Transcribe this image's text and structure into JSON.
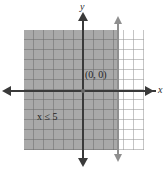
{
  "figure": {
    "name": "linear-inequality-graph",
    "origin_label": "(0, 0)",
    "inequality_variable": "x",
    "inequality_relation": "≤",
    "inequality_value": "5",
    "inequality_label": "x ≤ 5",
    "axis": {
      "x_label": "x",
      "y_label": "y"
    },
    "colors": {
      "shaded_region": "#a9a9a9",
      "grid_line": "#969696",
      "axis_line": "#3a3a3a",
      "boundary_line": "#8f8f8f",
      "background": "#ffffff"
    }
  },
  "chart_data": {
    "type": "line",
    "title": "",
    "xlabel": "x",
    "ylabel": "y",
    "xlim": [
      -6,
      6
    ],
    "ylim": [
      -6,
      6
    ],
    "grid": true,
    "legend": "none",
    "origin_annotation": "(0, 0)",
    "annotations": [
      {
        "text": "x ≤ 5",
        "x": -4.5,
        "y": -2.2
      },
      {
        "text": "(0, 0)",
        "x": 0.3,
        "y": 1.0
      }
    ],
    "series": [
      {
        "name": "boundary x = 5",
        "type": "vertical-line",
        "x": 5,
        "style": "solid",
        "color": "#8f8f8f"
      }
    ],
    "shaded_regions": [
      {
        "name": "solution set",
        "condition": "x <= 5",
        "x_range": [
          -6,
          5
        ],
        "y_range": [
          -6,
          6
        ],
        "color": "#a9a9a9"
      }
    ],
    "grid_spacing": 1
  }
}
